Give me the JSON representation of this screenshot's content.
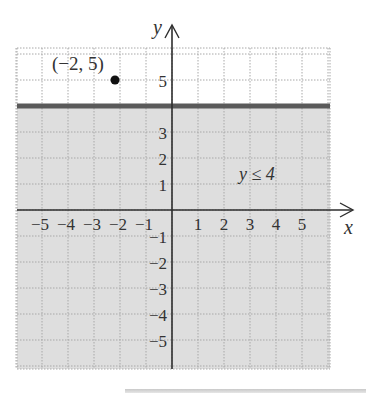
{
  "chart_data": {
    "type": "inequality-graph",
    "title": "",
    "inequality": "y ≤ 4",
    "boundary_line": {
      "equation": "y = 4",
      "style": "solid"
    },
    "shaded_region": "below y = 4",
    "point": {
      "x": -2,
      "y": 5,
      "label": "(−2, 5)"
    },
    "xlabel": "x",
    "ylabel": "y",
    "xlim": [
      -6,
      6
    ],
    "ylim": [
      -6,
      6
    ],
    "x_tick_labels": [
      "−5",
      "−4",
      "−3",
      "−2",
      "−1",
      "1",
      "2",
      "3",
      "4",
      "5"
    ],
    "y_tick_labels": [
      "5",
      "3",
      "2",
      "1",
      "−1",
      "−2",
      "−3",
      "−4",
      "−5"
    ],
    "grid": true
  },
  "labels": {
    "point_label": "(−2, 5)",
    "region_label": "y ≤ 4",
    "x_axis": "x",
    "y_axis": "y",
    "x_ticks": [
      {
        "v": -5,
        "t": "−5"
      },
      {
        "v": -4,
        "t": "−4"
      },
      {
        "v": -3,
        "t": "−3"
      },
      {
        "v": -2,
        "t": "−2"
      },
      {
        "v": -1,
        "t": "−1"
      },
      {
        "v": 1,
        "t": "1"
      },
      {
        "v": 2,
        "t": "2"
      },
      {
        "v": 3,
        "t": "3"
      },
      {
        "v": 4,
        "t": "4"
      },
      {
        "v": 5,
        "t": "5"
      }
    ],
    "y_ticks": [
      {
        "v": 5,
        "t": "5"
      },
      {
        "v": 3,
        "t": "3"
      },
      {
        "v": 2,
        "t": "2"
      },
      {
        "v": 1,
        "t": "1"
      },
      {
        "v": -1,
        "t": "−1"
      },
      {
        "v": -2,
        "t": "−2"
      },
      {
        "v": -3,
        "t": "−3"
      },
      {
        "v": -4,
        "t": "−4"
      },
      {
        "v": -5,
        "t": "−5"
      }
    ]
  },
  "colors": {
    "shade": "#dedede",
    "boundary": "#5a5a5a",
    "grid": "#a8a8a8",
    "axis": "#2e2e2e",
    "point": "#111111"
  }
}
